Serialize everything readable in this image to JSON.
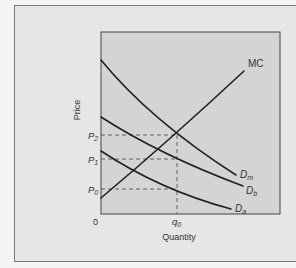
{
  "figure": {
    "y_axis_label": "Price",
    "x_axis_label": "Quantity",
    "origin_label": "0",
    "price_ticks": [
      {
        "label": "P",
        "sub": "2"
      },
      {
        "label": "P",
        "sub": "1"
      },
      {
        "label": "P",
        "sub": "0"
      }
    ],
    "quantity_tick": {
      "label": "q",
      "sub": "0"
    },
    "curves": {
      "mc": "MC",
      "dm": {
        "label": "D",
        "sub": "m"
      },
      "db": {
        "label": "D",
        "sub": "b"
      },
      "da": {
        "label": "D",
        "sub": "a"
      }
    },
    "colors": {
      "outer_bg": "#e6e6e6",
      "plot_bg": "#d4d4d4",
      "curve": "#222222",
      "dashed": "#555555"
    }
  }
}
